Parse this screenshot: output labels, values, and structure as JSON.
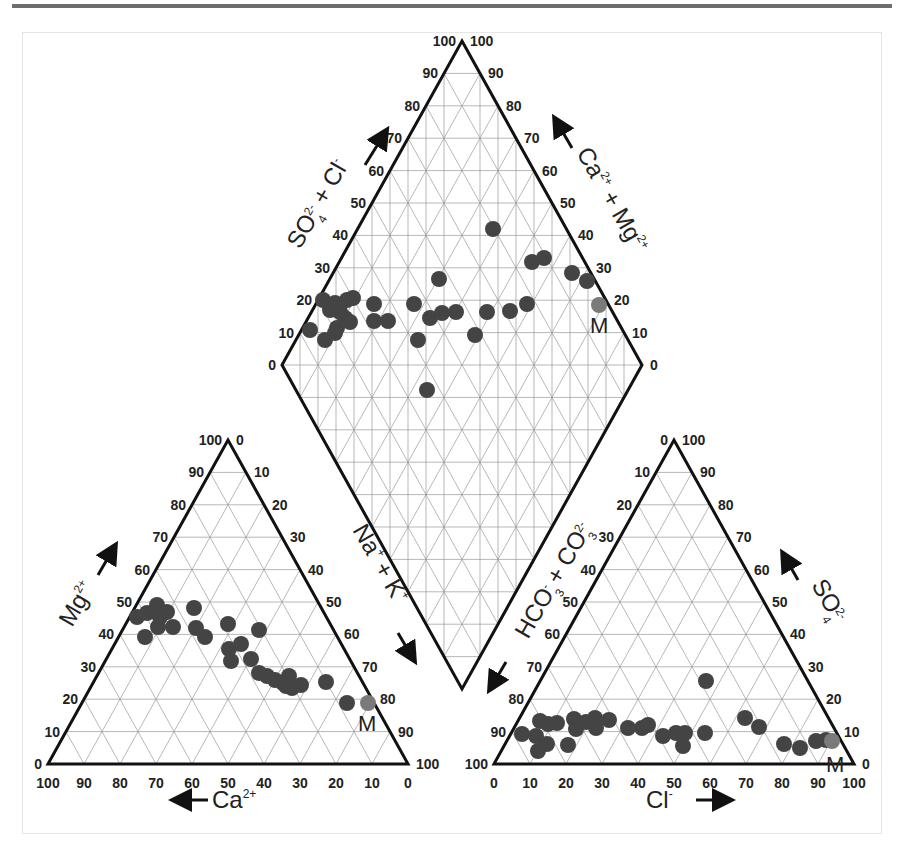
{
  "page": {
    "top_rule": true
  },
  "chart_data": {
    "type": "scatter",
    "subtype": "piper-diagram",
    "title": "",
    "marker_color": "#444444",
    "highlight_color": "#7a7a7a",
    "highlight_label": "M",
    "panels": [
      {
        "name": "cation-triangle",
        "axes": {
          "left": {
            "label": "Mg2+",
            "ticks": [
              "0",
              "10",
              "20",
              "30",
              "40",
              "50",
              "60",
              "70",
              "80",
              "90",
              "100"
            ]
          },
          "right": {
            "label": "Na+ + K+",
            "ticks": [
              "0",
              "10",
              "20",
              "30",
              "40",
              "50",
              "60",
              "70",
              "80",
              "90",
              "100"
            ]
          },
          "bottom": {
            "label": "Ca2+",
            "ticks": [
              "100",
              "90",
              "80",
              "70",
              "60",
              "50",
              "40",
              "30",
              "20",
              "10",
              "0"
            ]
          }
        },
        "points_pct": [
          {
            "Ca": 48,
            "Mg": 44
          },
          {
            "Ca": 46,
            "Mg": 45
          },
          {
            "Ca": 44,
            "Mg": 46
          },
          {
            "Ca": 44,
            "Mg": 43
          },
          {
            "Ca": 42,
            "Mg": 44
          },
          {
            "Ca": 45,
            "Mg": 41
          },
          {
            "Ca": 49,
            "Mg": 38
          },
          {
            "Ca": 41,
            "Mg": 41
          },
          {
            "Ca": 37,
            "Mg": 45
          },
          {
            "Ca": 38,
            "Mg": 40
          },
          {
            "Ca": 37,
            "Mg": 38
          },
          {
            "Ca": 30,
            "Mg": 42
          },
          {
            "Ca": 33,
            "Mg": 34
          },
          {
            "Ca": 33,
            "Mg": 32
          },
          {
            "Ca": 30,
            "Mg": 35
          },
          {
            "Ca": 24,
            "Mg": 40
          },
          {
            "Ca": 29,
            "Mg": 32
          },
          {
            "Ca": 28,
            "Mg": 28
          },
          {
            "Ca": 27,
            "Mg": 27
          },
          {
            "Ca": 25,
            "Mg": 26
          },
          {
            "Ca": 24,
            "Mg": 25
          },
          {
            "Ca": 24,
            "Mg": 24
          },
          {
            "Ca": 22,
            "Mg": 26
          },
          {
            "Ca": 21,
            "Mg": 25
          },
          {
            "Ca": 14,
            "Mg": 25
          },
          {
            "Ca": 12,
            "Mg": 19
          },
          {
            "Ca": 6,
            "Mg": 19,
            "label": "M"
          }
        ]
      },
      {
        "name": "diamond",
        "axes": {
          "upper-left": {
            "label": "SO42- + Cl-",
            "ticks": [
              "0",
              "10",
              "20",
              "30",
              "40",
              "50",
              "60",
              "70",
              "80",
              "90",
              "100"
            ]
          },
          "upper-right": {
            "label": "Ca2+ + Mg2+",
            "ticks": [
              "100",
              "90",
              "80",
              "70",
              "60",
              "50",
              "40",
              "30",
              "20",
              "10",
              "0"
            ]
          }
        },
        "points_note": "plotted positions in diamond"
      },
      {
        "name": "anion-triangle",
        "axes": {
          "left": {
            "label": "HCO3- + CO32-",
            "ticks": [
              "0",
              "10",
              "20",
              "30",
              "40",
              "50",
              "60",
              "70",
              "80",
              "90",
              "100"
            ]
          },
          "right": {
            "label": "SO42-",
            "ticks": [
              "0",
              "10",
              "20",
              "30",
              "40",
              "50",
              "60",
              "70",
              "80",
              "90",
              "100"
            ]
          },
          "bottom": {
            "label": "Cl-",
            "ticks": [
              "0",
              "10",
              "20",
              "30",
              "40",
              "50",
              "60",
              "70",
              "80",
              "90",
              "100"
            ]
          }
        },
        "points_pct": [
          {
            "Cl": 10,
            "SO4": 9
          },
          {
            "Cl": 14,
            "SO4": 8
          },
          {
            "Cl": 14,
            "SO4": 13
          },
          {
            "Cl": 17,
            "SO4": 12
          },
          {
            "Cl": 19,
            "SO4": 12
          },
          {
            "Cl": 16,
            "SO4": 6
          },
          {
            "Cl": 13,
            "SO4": 4
          },
          {
            "Cl": 22,
            "SO4": 6
          },
          {
            "Cl": 24,
            "SO4": 14
          },
          {
            "Cl": 25,
            "SO4": 11
          },
          {
            "Cl": 28,
            "SO4": 13
          },
          {
            "Cl": 30,
            "SO4": 14
          },
          {
            "Cl": 30,
            "SO4": 11
          },
          {
            "Cl": 34,
            "SO4": 13
          },
          {
            "Cl": 39,
            "SO4": 11
          },
          {
            "Cl": 43,
            "SO4": 10
          },
          {
            "Cl": 45,
            "SO4": 11
          },
          {
            "Cl": 49,
            "SO4": 8
          },
          {
            "Cl": 53,
            "SO4": 11
          },
          {
            "Cl": 54,
            "SO4": 9
          },
          {
            "Cl": 56,
            "SO4": 9
          },
          {
            "Cl": 56,
            "SO4": 5
          },
          {
            "Cl": 62,
            "SO4": 9
          },
          {
            "Cl": 57,
            "SO4": 25
          },
          {
            "Cl": 71,
            "SO4": 14
          },
          {
            "Cl": 75,
            "SO4": 11
          },
          {
            "Cl": 82,
            "SO4": 6
          },
          {
            "Cl": 86,
            "SO4": 5
          },
          {
            "Cl": 90,
            "SO4": 7
          },
          {
            "Cl": 93,
            "SO4": 7
          },
          {
            "Cl": 94,
            "SO4": 7,
            "label": "M"
          }
        ]
      }
    ],
    "pixel_points": {
      "left": [
        [
          137,
          617
        ],
        [
          147,
          613
        ],
        [
          157,
          605
        ],
        [
          160,
          617
        ],
        [
          167,
          612
        ],
        [
          158,
          627
        ],
        [
          145,
          637
        ],
        [
          173,
          627
        ],
        [
          194,
          608
        ],
        [
          196,
          628
        ],
        [
          205,
          637
        ],
        [
          228,
          624
        ],
        [
          229,
          649
        ],
        [
          231,
          661
        ],
        [
          241,
          644
        ],
        [
          259,
          630
        ],
        [
          251,
          659
        ],
        [
          259,
          673
        ],
        [
          267,
          676
        ],
        [
          275,
          680
        ],
        [
          283,
          683
        ],
        [
          289,
          676
        ],
        [
          286,
          686
        ],
        [
          292,
          688
        ],
        [
          301,
          685
        ],
        [
          326,
          682
        ],
        [
          347,
          703
        ]
      ],
      "left_m": [
        368,
        703
      ],
      "diamond": [
        [
          310,
          330
        ],
        [
          323,
          300
        ],
        [
          330,
          310
        ],
        [
          335,
          303
        ],
        [
          340,
          312
        ],
        [
          347,
          300
        ],
        [
          353,
          298
        ],
        [
          345,
          318
        ],
        [
          337,
          328
        ],
        [
          325,
          340
        ],
        [
          335,
          333
        ],
        [
          350,
          322
        ],
        [
          374,
          304
        ],
        [
          374,
          321
        ],
        [
          388,
          321
        ],
        [
          414,
          304
        ],
        [
          418,
          340
        ],
        [
          427,
          390
        ],
        [
          493,
          229
        ],
        [
          439,
          279
        ],
        [
          430,
          318
        ],
        [
          442,
          313
        ],
        [
          456,
          312
        ],
        [
          487,
          312
        ],
        [
          510,
          311
        ],
        [
          527,
          304
        ],
        [
          475,
          335
        ],
        [
          532,
          262
        ],
        [
          544,
          258
        ],
        [
          572,
          273
        ],
        [
          587,
          281
        ]
      ],
      "diamond_m": [
        599,
        305
      ],
      "right": [
        [
          522,
          734
        ],
        [
          536,
          736
        ],
        [
          540,
          721
        ],
        [
          548,
          724
        ],
        [
          557,
          723
        ],
        [
          547,
          744
        ],
        [
          538,
          751
        ],
        [
          568,
          745
        ],
        [
          574,
          719
        ],
        [
          576,
          729
        ],
        [
          586,
          722
        ],
        [
          595,
          718
        ],
        [
          596,
          728
        ],
        [
          609,
          720
        ],
        [
          628,
          728
        ],
        [
          642,
          728
        ],
        [
          648,
          725
        ],
        [
          663,
          736
        ],
        [
          676,
          733
        ],
        [
          685,
          733
        ],
        [
          683,
          746
        ],
        [
          705,
          733
        ],
        [
          706,
          681
        ],
        [
          745,
          718
        ],
        [
          759,
          727
        ],
        [
          784,
          744
        ],
        [
          800,
          748
        ],
        [
          816,
          741
        ],
        [
          826,
          740
        ]
      ],
      "right_m": [
        832,
        741
      ]
    }
  },
  "labels": {
    "so4_cl": "SO",
    "so4_sub": "4",
    "so4_sup": "2-",
    "plus": "+",
    "cl": "Cl",
    "cl_sup": "-",
    "ca": "Ca",
    "ca_sup": "2+",
    "mg": "Mg",
    "mg_sup": "2+",
    "na": "Na",
    "na_sup": "+",
    "k": "K",
    "k_sup": "+",
    "hco": "HCO",
    "hco_sub": "3",
    "hco_sup": "-",
    "co": "CO",
    "co_sub": "3",
    "co_sup": "2-",
    "so": "SO",
    "so_sub": "4",
    "so_sup": "2-",
    "m": "M"
  }
}
